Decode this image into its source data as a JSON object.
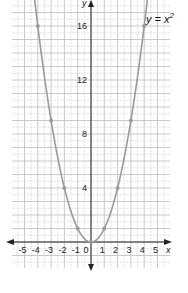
{
  "chart_data": {
    "type": "line",
    "title": "",
    "equation_label": "y = x",
    "equation_exponent": "2",
    "xlabel": "x",
    "ylabel": "y",
    "x_ticks": [
      -5,
      -4,
      -3,
      -2,
      -1,
      0,
      1,
      2,
      3,
      4,
      5
    ],
    "x_tick_labels": [
      "-5",
      "-4",
      "-3",
      "-2",
      "-1",
      "0",
      "1",
      "2",
      "3",
      "4",
      "5"
    ],
    "y_ticks": [
      4,
      8,
      12,
      16
    ],
    "y_tick_labels": [
      "4",
      "8",
      "12",
      "16"
    ],
    "xlim": [
      -6,
      6
    ],
    "ylim": [
      -2,
      18
    ],
    "grid": true,
    "series": [
      {
        "name": "y = x^2",
        "color": "#9a9a9a",
        "points": [
          {
            "x": -4,
            "y": 16
          },
          {
            "x": -3,
            "y": 9
          },
          {
            "x": -2,
            "y": 4
          },
          {
            "x": -1,
            "y": 1
          },
          {
            "x": 0,
            "y": 0
          },
          {
            "x": 1,
            "y": 1
          },
          {
            "x": 2,
            "y": 4
          },
          {
            "x": 3,
            "y": 9
          },
          {
            "x": 4,
            "y": 16
          }
        ]
      }
    ]
  },
  "colors": {
    "grid_major": "#bdbdbd",
    "grid_minor": "#dcdcdc",
    "axis": "#222222",
    "curve": "#9a9a9a",
    "background": "#ffffff"
  }
}
